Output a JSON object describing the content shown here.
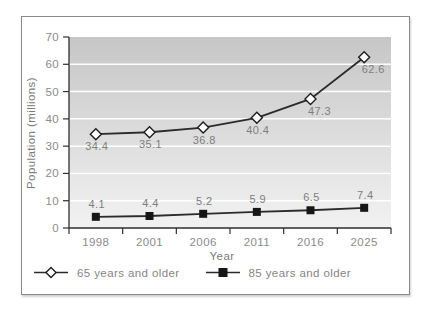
{
  "chart_data": {
    "type": "line",
    "title": "",
    "xlabel": "Year",
    "ylabel": "Population (millions)",
    "categories": [
      "1998",
      "2001",
      "2006",
      "2011",
      "2016",
      "2025"
    ],
    "series": [
      {
        "name": "65 years and older",
        "marker": "diamond",
        "marker_fill": "#ffffff",
        "values": [
          34.4,
          35.1,
          36.8,
          40.4,
          47.3,
          62.6
        ],
        "data_label_position": "below"
      },
      {
        "name": "85 years and older",
        "marker": "square",
        "marker_fill": "#161616",
        "values": [
          4.1,
          4.4,
          5.2,
          5.9,
          6.5,
          7.4
        ],
        "data_label_position": "above"
      }
    ],
    "ylim": [
      0,
      70
    ],
    "yticks": [
      0,
      10,
      20,
      30,
      40,
      50,
      60,
      70
    ],
    "grid": "horizontal-white-lines",
    "legend_position": "bottom",
    "colors": {
      "line": "#2b2b2b",
      "axis": "#2f2f2f",
      "gridline": "#ffffff",
      "plot_bg_top": "#c6c6c6",
      "plot_bg_bottom": "#f2f2f2",
      "text": "#8b8b8b"
    }
  }
}
